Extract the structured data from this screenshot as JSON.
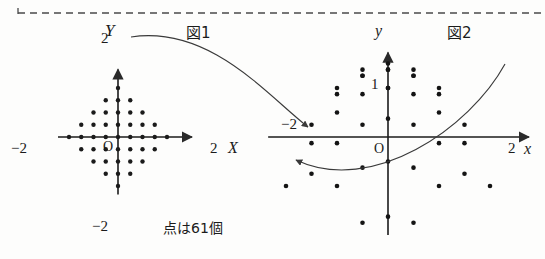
{
  "page": {
    "background": "#fdfdfc",
    "ink": "#1b1b1b",
    "width": 545,
    "height": 259
  },
  "top_rule": {
    "name": "dashed-divider",
    "style": "dashed",
    "color": "#4a4a4a",
    "y": 13,
    "x_start": 18,
    "x_end": 545,
    "tick_label": ""
  },
  "figures": [
    {
      "id": "fig1",
      "caption": "図1",
      "caption_x": 186,
      "caption_y": 26,
      "axes": {
        "x_label": "X",
        "y_label": "Y",
        "origin_label": "O",
        "x_ticks": [
          {
            "value": -2,
            "label": "−2"
          },
          {
            "value": 2,
            "label": "2"
          }
        ],
        "y_ticks": [
          {
            "value": 2,
            "label": "2"
          },
          {
            "value": -2,
            "label": "−2"
          }
        ],
        "x_range": [
          -2.45,
          2.45
        ],
        "y_range": [
          -2.35,
          2.35
        ]
      },
      "note": "点は61個",
      "note_x": 163,
      "note_y": 227,
      "origin_px": {
        "x": 118,
        "y": 137
      },
      "scale_px": 24.5,
      "dot_radius": 2.2,
      "lattice": {
        "description": "diamond |X|+|Y| <= 2, spacing 0.5",
        "spacing": 0.5,
        "bound": 2,
        "count": 61
      }
    },
    {
      "id": "fig2",
      "caption": "図2",
      "caption_x": 447,
      "caption_y": 26,
      "axes": {
        "x_label": "x",
        "y_label": "y",
        "origin_label": "O",
        "x_ticks": [
          {
            "value": -2,
            "label": "−2"
          },
          {
            "value": 2,
            "label": "2"
          }
        ],
        "y_ticks": [
          {
            "value": 1,
            "label": "1"
          }
        ],
        "x_range": [
          -2.35,
          2.45
        ],
        "y_range": [
          -2.0,
          1.6
        ]
      },
      "origin_px": {
        "x": 388,
        "y": 137
      },
      "scale_px": 51,
      "scale_py": 49,
      "dot_radius": 2.3,
      "mapping": {
        "description": "image of fig1 lattice under (X,Y) -> (x,y)",
        "x": "X + Y*0",
        "formula_x": "u = X",
        "formula_y": "v = 1 - (X*X + Y*Y)/2 - Y"
      }
    }
  ],
  "connectors": [
    {
      "name": "arc-arrow-upper",
      "from": "fig1-top",
      "to": "fig2-right",
      "arrowhead": "end",
      "path": "M 131 37 C 210 25 268 96 308 127"
    },
    {
      "name": "arc-arrow-lower",
      "from": "fig1-right",
      "to": "fig2-left",
      "arrowhead": "end",
      "path": "M 505 64 C 470 128 372 196 296 160"
    }
  ]
}
